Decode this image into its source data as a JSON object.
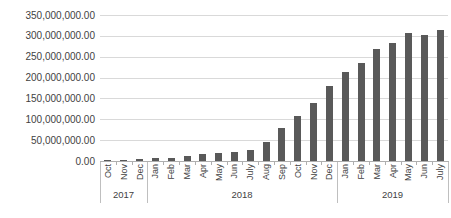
{
  "chart_data": {
    "type": "bar",
    "title": "",
    "xlabel": "",
    "ylabel": "",
    "legend": "none",
    "grid": true,
    "ylim": [
      0,
      350000000
    ],
    "y_tick_labels": [
      "350,000,000.00",
      "300,000,000.00",
      "250,000,000.00",
      "200,000,000.00",
      "150,000,000.00",
      "100,000,000.00",
      "50,000,000.00",
      "0.00"
    ],
    "categories": [
      "Oct",
      "Nov",
      "Dec",
      "Jan",
      "Feb",
      "Mar",
      "Apr",
      "May",
      "Jun",
      "July",
      "Aug",
      "Sep",
      "Oct",
      "Nov",
      "Dec",
      "Jan",
      "Feb",
      "Mar",
      "Apr",
      "May",
      "Jun",
      "July"
    ],
    "year_groups": [
      {
        "label": "2017",
        "count": 3
      },
      {
        "label": "2018",
        "count": 12
      },
      {
        "label": "2019",
        "count": 7
      }
    ],
    "values": [
      2000000,
      3000000,
      5000000,
      6000000,
      8000000,
      13000000,
      16000000,
      19000000,
      22000000,
      27000000,
      46000000,
      78000000,
      108000000,
      139000000,
      180000000,
      214000000,
      235000000,
      268000000,
      283000000,
      308000000,
      303000000,
      313000000
    ],
    "colors": {
      "bar": "#595959",
      "gridline": "#d9d9d9",
      "axis": "#afafaf",
      "separator": "#bfbfbf",
      "label": "#3f3f3f",
      "background": "#ffffff"
    }
  }
}
